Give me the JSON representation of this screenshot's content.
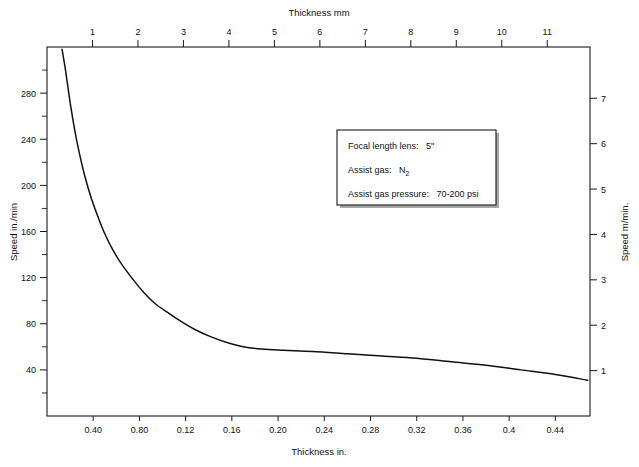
{
  "chart_data": {
    "type": "line",
    "title": "",
    "xlabel": "Thickness in.",
    "ylabel": "Speed in./min",
    "x2label": "Thickness mm",
    "y2label": "Speed m/min.",
    "grid": false,
    "legend": "none",
    "xlim": [
      0.0,
      0.47
    ],
    "ylim": [
      0,
      320
    ],
    "x2lim": [
      0.0,
      11.94
    ],
    "y2lim": [
      0,
      8.13
    ],
    "x_tick_labels": [
      "0.40",
      "0.80",
      "0.12",
      "0.16",
      "0.20",
      "0.24",
      "0.28",
      "0.32",
      "0.36",
      "0.4",
      "0.44"
    ],
    "x_tick_values": [
      0.04,
      0.08,
      0.12,
      0.16,
      0.2,
      0.24,
      0.28,
      0.32,
      0.36,
      0.4,
      0.44
    ],
    "x2_tick_labels": [
      "1",
      "2",
      "3",
      "4",
      "5",
      "6",
      "7",
      "8",
      "9",
      "10",
      "11"
    ],
    "x2_tick_values": [
      1,
      2,
      3,
      4,
      5,
      6,
      7,
      8,
      9,
      10,
      11
    ],
    "y_tick_labels": [
      "40",
      "80",
      "120",
      "160",
      "200",
      "240",
      "280"
    ],
    "y_tick_values": [
      40,
      80,
      120,
      160,
      200,
      240,
      280
    ],
    "y_minor_tick_values": [
      20,
      60,
      100,
      140,
      180,
      220,
      260,
      300
    ],
    "y2_tick_labels": [
      "1",
      "2",
      "3",
      "4",
      "5",
      "6",
      "7"
    ],
    "y2_tick_values": [
      1,
      2,
      3,
      4,
      5,
      6,
      7
    ],
    "series": [
      {
        "name": "Cutting speed vs thickness",
        "x": [
          0.013,
          0.016,
          0.02,
          0.024,
          0.028,
          0.033,
          0.038,
          0.044,
          0.05,
          0.057,
          0.065,
          0.074,
          0.083,
          0.093,
          0.104,
          0.116,
          0.128,
          0.141,
          0.155,
          0.17,
          0.186,
          0.205,
          0.23,
          0.26,
          0.29,
          0.32,
          0.35,
          0.38,
          0.41,
          0.44,
          0.468
        ],
        "y": [
          318,
          300,
          272,
          248,
          228,
          207,
          190,
          173,
          158,
          144,
          131,
          119,
          108,
          98,
          90,
          82,
          75,
          69,
          64,
          60,
          58,
          57,
          56,
          54,
          52,
          50,
          47,
          44,
          40,
          36,
          31
        ]
      }
    ],
    "annotation_box": {
      "lines": [
        {
          "label": "Focal length lens:",
          "value": "5\"",
          "sub": ""
        },
        {
          "label": "Assist gas:",
          "value": "N",
          "sub": "2"
        },
        {
          "label": "Assist gas pressure:",
          "value": "70-200 psi",
          "sub": ""
        }
      ]
    }
  },
  "colors": {
    "curve": "#111111",
    "axis": "#1a1a1a",
    "background": "#ffffff",
    "text": "#111111"
  }
}
